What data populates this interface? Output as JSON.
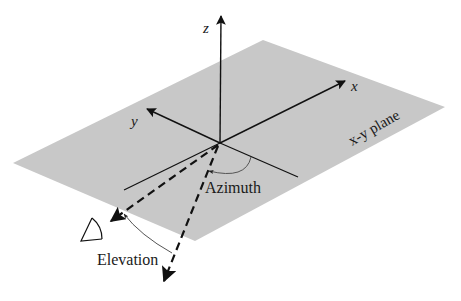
{
  "diagram": {
    "colors": {
      "plane": "#c8c8c8",
      "axis": "#111111",
      "arc": "#555555",
      "background": "#ffffff"
    },
    "axes": {
      "x_label": "x",
      "y_label": "y",
      "z_label": "z"
    },
    "plane_label": "x-y plane",
    "angles": {
      "azimuth_label": "Azimuth",
      "elevation_label": "Elevation"
    },
    "elements": [
      {
        "id": "xy-plane",
        "type": "parallelogram",
        "label": "x-y plane"
      },
      {
        "id": "z-axis",
        "type": "arrow",
        "label": "z"
      },
      {
        "id": "x-axis",
        "type": "arrow",
        "label": "x"
      },
      {
        "id": "y-axis",
        "type": "arrow",
        "label": "y"
      },
      {
        "id": "projection-direction",
        "type": "dashed-arrow",
        "label": "direction projected on x-y plane"
      },
      {
        "id": "source-direction",
        "type": "dashed-arrow",
        "label": "direction to source"
      },
      {
        "id": "azimuth-arc",
        "type": "arc-arrow",
        "label": "Azimuth"
      },
      {
        "id": "elevation-arc",
        "type": "arc-arrow",
        "label": "Elevation"
      },
      {
        "id": "observer-eye",
        "type": "icon",
        "label": "eye"
      }
    ]
  }
}
